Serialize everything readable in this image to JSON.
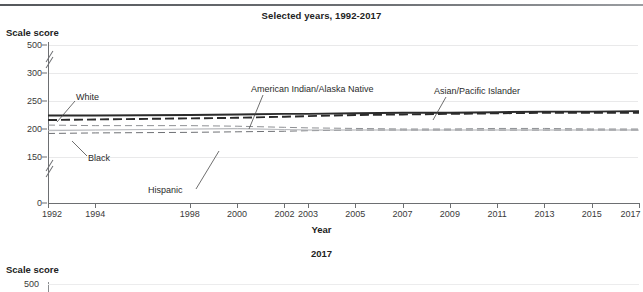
{
  "page": {
    "clipped_top_text": "",
    "subtitle": "Selected years, 1992-2017"
  },
  "axes": {
    "y_title": "Scale score",
    "x_title": "Year"
  },
  "next_chart": {
    "title": "2017",
    "y_title": "Scale score",
    "first_tick": "500"
  },
  "chart_data": {
    "type": "line",
    "title": "Selected years, 1992-2017",
    "subtitle": "Selected years, 1992-2017",
    "xlabel": "Year",
    "ylabel": "Scale score",
    "grid": true,
    "legend": "inline-annotations",
    "x": [
      1992,
      1994,
      1998,
      2000,
      2002,
      2003,
      2005,
      2007,
      2009,
      2011,
      2013,
      2015,
      2017
    ],
    "xlim": [
      1992,
      2017
    ],
    "ylim": [
      0,
      500
    ],
    "y_ticks": [
      "500",
      "300",
      "250",
      "200",
      "150",
      "0"
    ],
    "y_tick_values": [
      500,
      300,
      250,
      200,
      150,
      0
    ],
    "y_axis_breaks": [
      [
        300,
        500
      ],
      [
        0,
        150
      ]
    ],
    "x_tick_labels": [
      "1992",
      "1994",
      "1998",
      "2000",
      "2002",
      "2003",
      "2005",
      "2007",
      "2009",
      "2011",
      "2013",
      "2015",
      "2017"
    ],
    "series": [
      {
        "name": "White",
        "style": "solid-thick-dark",
        "color": "#2b2b2b",
        "label_x": 2017,
        "values": [
          224,
          224,
          225,
          226,
          227,
          227,
          228,
          229,
          229,
          230,
          231,
          231,
          232
        ]
      },
      {
        "name": "Asian/Pacific Islander",
        "style": "dashed-thick-dark",
        "color": "#2b2b2b",
        "values": [
          216,
          217,
          219,
          220,
          222,
          223,
          225,
          226,
          227,
          228,
          229,
          229,
          229
        ]
      },
      {
        "name": "American Indian/Alaska Native",
        "style": "dashed-thin-gray",
        "color": "#8e9094",
        "values": [
          207,
          206,
          206,
          205,
          203,
          202,
          201,
          200,
          200,
          201,
          201,
          200,
          200
        ]
      },
      {
        "name": "Black",
        "style": "dashed-thin-gray",
        "color": "#6f7175",
        "values": [
          192,
          193,
          194,
          195,
          196,
          197,
          198,
          198,
          198,
          198,
          198,
          198,
          198
        ]
      },
      {
        "name": "Hispanic",
        "style": "solid-thin-light",
        "color": "#b7b9bd",
        "values": [
          197,
          198,
          200,
          201,
          199,
          198,
          198,
          198,
          198,
          198,
          198,
          198,
          198
        ]
      }
    ],
    "annotations": [
      {
        "text": "White",
        "x_px": 76,
        "y_px": 98
      },
      {
        "text": "Black",
        "x_px": 88,
        "y_px": 159
      },
      {
        "text": "Hispanic",
        "x_px": 148,
        "y_px": 192
      },
      {
        "text": "American Indian/Alaska Native",
        "x_px": 251,
        "y_px": 90
      },
      {
        "text": "Asian/Pacific Islander",
        "x_px": 434,
        "y_px": 92
      }
    ]
  }
}
